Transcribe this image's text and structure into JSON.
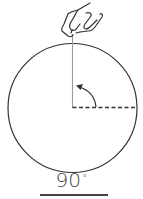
{
  "diagram": {
    "angle_label": "90",
    "degree_symbol": "°",
    "elements": {
      "hand": "pointing-hand-icon",
      "circle": {
        "cx": 72.5,
        "cy": 108,
        "r": 64.5
      },
      "reference_line": "vertical solid line from top of circle to center",
      "rotated_line": "horizontal dashed line from center to right edge",
      "arc_arrow": "counter-clockwise arrow from dashed line toward vertical line"
    },
    "colors": {
      "stroke": "#333333",
      "reference_line": "#999999",
      "text": "#444444"
    }
  }
}
